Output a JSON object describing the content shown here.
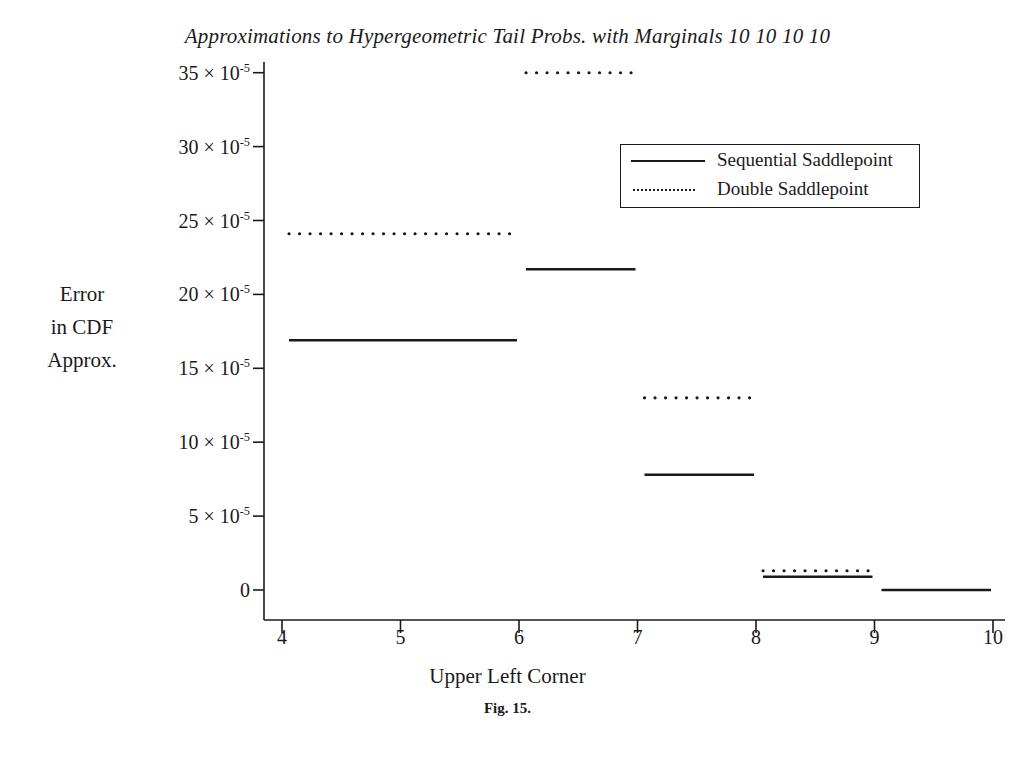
{
  "chart_data": {
    "type": "line",
    "title": "Approximations to Hypergeometric Tail Probs. with Marginals 10 10 10 10",
    "caption": "Fig. 15.",
    "xlabel": "Upper Left Corner",
    "ylabel": "Error in CDF Approx.",
    "ylabel_lines": [
      "Error",
      "in CDF",
      "Approx."
    ],
    "xlim": [
      3.6,
      10.4
    ],
    "ylim": [
      -1.5,
      36.5
    ],
    "grid": false,
    "legend_position": "upper right",
    "x_ticks": [
      4,
      5,
      6,
      7,
      8,
      9,
      10
    ],
    "x_tick_labels": [
      "4",
      "5",
      "6",
      "7",
      "8",
      "9",
      "10"
    ],
    "y_ticks": [
      0,
      5,
      10,
      15,
      20,
      25,
      30,
      35
    ],
    "y_tick_labels": [
      {
        "mantissa": "0",
        "exponent": ""
      },
      {
        "mantissa": "5",
        "exponent": "-5"
      },
      {
        "mantissa": "10",
        "exponent": "-5"
      },
      {
        "mantissa": "15",
        "exponent": "-5"
      },
      {
        "mantissa": "20",
        "exponent": "-5"
      },
      {
        "mantissa": "25",
        "exponent": "-5"
      },
      {
        "mantissa": "30",
        "exponent": "-5"
      },
      {
        "mantissa": "35",
        "exponent": "-5"
      }
    ],
    "y_unit": "x 10^-5",
    "series": [
      {
        "name": "Sequential Saddlepoint",
        "style": "solid",
        "color": "#1a1a1a",
        "steps": [
          {
            "x_start": 4,
            "x_end": 6,
            "value": 16.9
          },
          {
            "x_start": 6,
            "x_end": 7,
            "value": 21.7
          },
          {
            "x_start": 7,
            "x_end": 8,
            "value": 7.8
          },
          {
            "x_start": 8,
            "x_end": 9,
            "value": 0.9
          },
          {
            "x_start": 9,
            "x_end": 10,
            "value": 0.0
          }
        ]
      },
      {
        "name": "Double Saddlepoint",
        "style": "dotted",
        "color": "#1a1a1a",
        "steps": [
          {
            "x_start": 4,
            "x_end": 6,
            "value": 24.1
          },
          {
            "x_start": 6,
            "x_end": 7,
            "value": 35.0
          },
          {
            "x_start": 7,
            "x_end": 8,
            "value": 13.0
          },
          {
            "x_start": 8,
            "x_end": 9,
            "value": 1.3
          }
        ]
      }
    ]
  },
  "legend": {
    "entries": [
      {
        "label": "Sequential Saddlepoint",
        "style": "solid"
      },
      {
        "label": "Double Saddlepoint",
        "style": "dotted"
      }
    ]
  }
}
